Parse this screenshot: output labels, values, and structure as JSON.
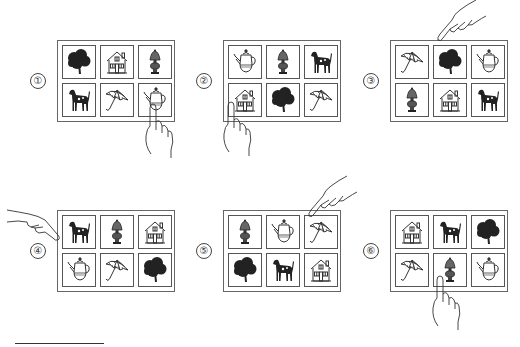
{
  "panels": [
    {
      "label": "①",
      "x": 57,
      "y": 40,
      "grid": [
        "tree",
        "house",
        "lamp",
        "dog",
        "umbrella",
        "teapot"
      ],
      "pointed": 5,
      "hand": "bottom-right"
    },
    {
      "label": "②",
      "x": 223,
      "y": 40,
      "grid": [
        "teapot",
        "lamp",
        "dog",
        "house",
        "tree",
        "umbrella"
      ],
      "pointed": 3,
      "hand": "bottom-left"
    },
    {
      "label": "③",
      "x": 390,
      "y": 40,
      "grid": [
        "umbrella",
        "tree",
        "teapot",
        "lamp",
        "house",
        "dog"
      ],
      "pointed": 1,
      "hand": "top"
    },
    {
      "label": "④",
      "x": 57,
      "y": 210,
      "grid": [
        "dog",
        "lamp",
        "house",
        "teapot",
        "umbrella",
        "tree"
      ],
      "pointed": 0,
      "hand": "left"
    },
    {
      "label": "⑤",
      "x": 223,
      "y": 210,
      "grid": [
        "lamp",
        "teapot",
        "umbrella",
        "tree",
        "dog",
        "house"
      ],
      "pointed": 2,
      "hand": "top-right"
    },
    {
      "label": "⑥",
      "x": 390,
      "y": 210,
      "grid": [
        "house",
        "dog",
        "tree",
        "umbrella",
        "lamp",
        "teapot"
      ],
      "pointed": 4,
      "hand": "bottom"
    }
  ],
  "icons": {
    "tree": "tree-icon",
    "house": "house-icon",
    "lamp": "lamp-icon",
    "dog": "dog-icon",
    "umbrella": "umbrella-icon",
    "teapot": "teapot-icon"
  }
}
